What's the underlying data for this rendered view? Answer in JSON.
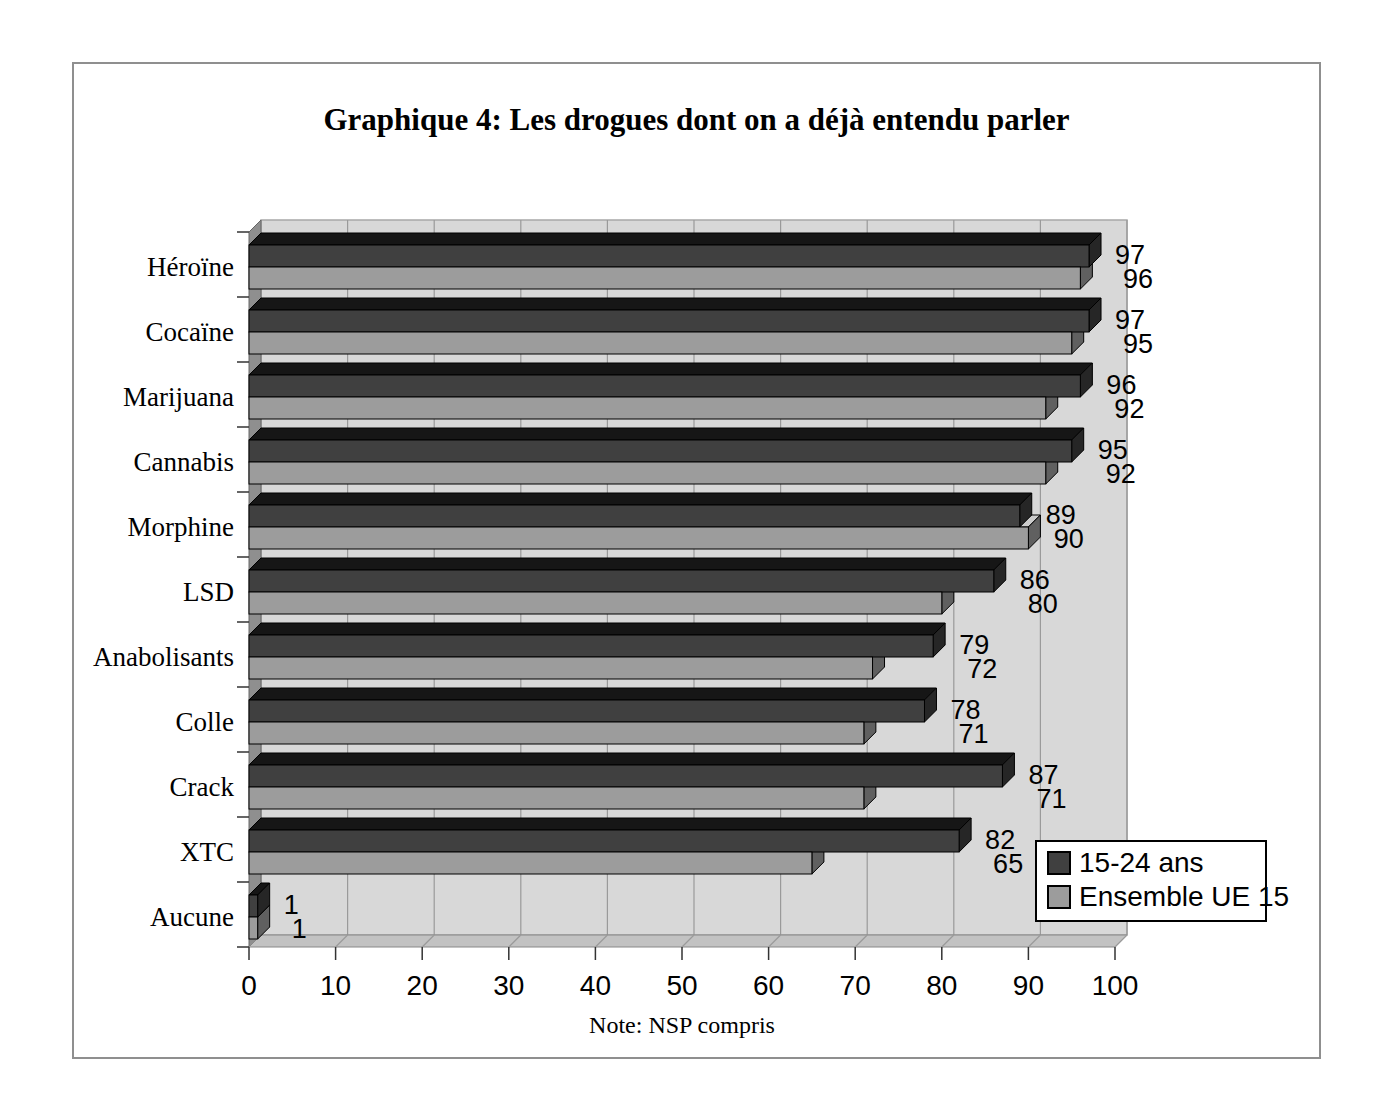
{
  "chart": {
    "title": "Graphique 4: Les drogues dont on a déjà entendu parler",
    "note": "Note: NSP compris"
  },
  "legend": {
    "items": [
      {
        "label": "15-24 ans",
        "color": "#404040"
      },
      {
        "label": "Ensemble UE 15",
        "color": "#9c9c9c"
      }
    ]
  },
  "colors": {
    "wall": "#d8d8d8",
    "wall_border": "#a8a8a8",
    "gridline": "#9a9a9a",
    "side_wall": "#8f8f8f",
    "floor": "#c2c2c2",
    "axis": "#333333",
    "dark_front": "#404040",
    "dark_top": "#161616",
    "dark_end": "#262626",
    "gray_front": "#9c9c9c",
    "gray_top": "#cccccc",
    "gray_end": "#606060"
  },
  "chart_data": {
    "type": "bar",
    "orientation": "horizontal",
    "style": "3d",
    "title": "Graphique 4: Les drogues dont on a déjà entendu parler",
    "note": "Note: NSP compris",
    "categories": [
      "Héroïne",
      "Cocaïne",
      "Marijuana",
      "Cannabis",
      "Morphine",
      "LSD",
      "Anabolisants",
      "Colle",
      "Crack",
      "XTC",
      "Aucune"
    ],
    "series": [
      {
        "name": "15-24 ans",
        "values": [
          97,
          97,
          96,
          95,
          89,
          86,
          79,
          78,
          87,
          82,
          1
        ]
      },
      {
        "name": "Ensemble UE 15",
        "values": [
          96,
          95,
          92,
          92,
          90,
          80,
          72,
          71,
          71,
          65,
          1
        ]
      }
    ],
    "xlabel": "",
    "ylabel": "",
    "xlim": [
      0,
      100
    ],
    "xticks": [
      0,
      10,
      20,
      30,
      40,
      50,
      60,
      70,
      80,
      90,
      100
    ],
    "grid": true,
    "data_labels": true,
    "legend_position": "bottom-right"
  }
}
